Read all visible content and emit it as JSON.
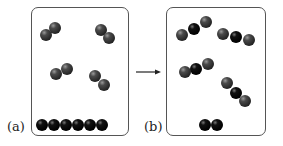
{
  "diagram": {
    "panels": [
      {
        "id": "a",
        "label": "(a)",
        "description": "Four gray diatomic molecules plus a row of six dark atoms (solid)"
      },
      {
        "id": "b",
        "label": "(b)",
        "description": "Four triatomic molecules (gray-dark-gray) plus two remaining dark atoms"
      }
    ],
    "arrow": {
      "direction": "right"
    },
    "colors": {
      "gray_atom": "#3a3a3a",
      "dark_atom": "#0a0a0a",
      "border": "#555555"
    }
  }
}
